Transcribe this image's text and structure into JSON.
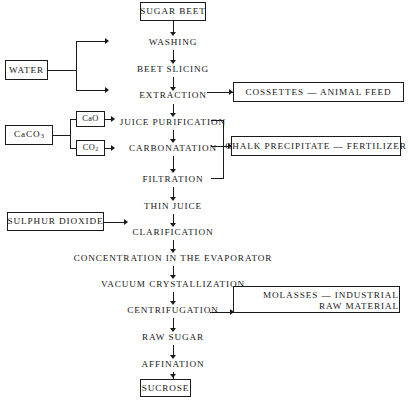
{
  "diagram": {
    "line_color": "#1a1a1a",
    "background": "#ffffff",
    "nodes": {
      "sugar_beet": "SUGAR BEET",
      "washing": "WASHING",
      "beet_slicing": "BEET SLICING",
      "extraction": "EXTRACTION",
      "juice_purification": "JUICE PURIFICATION",
      "carbonatation": "CARBONATATION",
      "filtration": "FILTRATION",
      "thin_juice": "THIN JUICE",
      "clarification": "CLARIFICATION",
      "concentration": "CONCENTRATION IN THE EVAPORATOR",
      "vacuum_crystallization": "VACUUM CRYSTALLIZATION",
      "centrifugation": "CENTRIFUGATION",
      "raw_sugar": "RAW SUGAR",
      "affination": "AFFINATION",
      "sucrose": "SUCROSE"
    },
    "inputs": {
      "water": "WATER",
      "calcium_carbonate": "CaCO",
      "calcium_carbonate_sub": "3",
      "calcium_oxide": "CaO",
      "carbon_dioxide": "CO",
      "carbon_dioxide_sub": "2",
      "sulphur_dioxide": "SULPHUR DIOXIDE"
    },
    "outputs": {
      "cossettes": "COSSETTES — ANIMAL FEED",
      "chalk_precipitate": "CHALK PRECIPITATE — FERTILIZER",
      "molasses_line1": "MOLASSES — INDUSTRIAL",
      "molasses_line2": "RAW MATERIAL"
    }
  }
}
